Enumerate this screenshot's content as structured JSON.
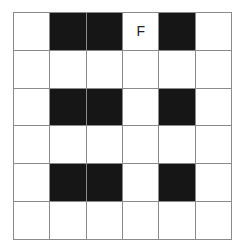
{
  "grid": {
    "rows": 6,
    "cols": 6,
    "colors": {
      "filled": "#161616",
      "empty": "#ffffff",
      "line": "#8a8a8a"
    },
    "cells": [
      [
        {
          "fill": false,
          "label": ""
        },
        {
          "fill": true,
          "label": ""
        },
        {
          "fill": true,
          "label": ""
        },
        {
          "fill": false,
          "label": "F"
        },
        {
          "fill": true,
          "label": ""
        },
        {
          "fill": false,
          "label": ""
        }
      ],
      [
        {
          "fill": false,
          "label": ""
        },
        {
          "fill": false,
          "label": ""
        },
        {
          "fill": false,
          "label": ""
        },
        {
          "fill": false,
          "label": ""
        },
        {
          "fill": false,
          "label": ""
        },
        {
          "fill": false,
          "label": ""
        }
      ],
      [
        {
          "fill": false,
          "label": ""
        },
        {
          "fill": true,
          "label": ""
        },
        {
          "fill": true,
          "label": ""
        },
        {
          "fill": false,
          "label": ""
        },
        {
          "fill": true,
          "label": ""
        },
        {
          "fill": false,
          "label": ""
        }
      ],
      [
        {
          "fill": false,
          "label": ""
        },
        {
          "fill": false,
          "label": ""
        },
        {
          "fill": false,
          "label": ""
        },
        {
          "fill": false,
          "label": ""
        },
        {
          "fill": false,
          "label": ""
        },
        {
          "fill": false,
          "label": ""
        }
      ],
      [
        {
          "fill": false,
          "label": ""
        },
        {
          "fill": true,
          "label": ""
        },
        {
          "fill": true,
          "label": ""
        },
        {
          "fill": false,
          "label": ""
        },
        {
          "fill": true,
          "label": ""
        },
        {
          "fill": false,
          "label": ""
        }
      ],
      [
        {
          "fill": false,
          "label": ""
        },
        {
          "fill": false,
          "label": ""
        },
        {
          "fill": false,
          "label": ""
        },
        {
          "fill": false,
          "label": ""
        },
        {
          "fill": false,
          "label": ""
        },
        {
          "fill": false,
          "label": ""
        }
      ]
    ]
  }
}
